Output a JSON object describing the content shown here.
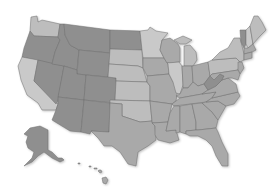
{
  "map": {
    "title": "United States map",
    "colors": {
      "dark": "#8f8f8f",
      "medium": "#a9a9a9",
      "light": "#bdbdbd",
      "lighter": "#c9c9c9",
      "border": "#6e6e6e",
      "background": "#ffffff"
    },
    "regions": [
      {
        "id": "WA",
        "shade": "light"
      },
      {
        "id": "OR",
        "shade": "dark"
      },
      {
        "id": "CA",
        "shade": "lighter"
      },
      {
        "id": "NV",
        "shade": "dark"
      },
      {
        "id": "ID",
        "shade": "dark"
      },
      {
        "id": "MT",
        "shade": "dark"
      },
      {
        "id": "WY",
        "shade": "dark"
      },
      {
        "id": "UT",
        "shade": "dark"
      },
      {
        "id": "CO",
        "shade": "dark"
      },
      {
        "id": "AZ",
        "shade": "dark"
      },
      {
        "id": "NM",
        "shade": "dark"
      },
      {
        "id": "ND",
        "shade": "dark"
      },
      {
        "id": "SD",
        "shade": "light"
      },
      {
        "id": "NE",
        "shade": "light"
      },
      {
        "id": "KS",
        "shade": "light"
      },
      {
        "id": "OK",
        "shade": "light"
      },
      {
        "id": "TX",
        "shade": "medium"
      },
      {
        "id": "MN",
        "shade": "lighter"
      },
      {
        "id": "IA",
        "shade": "medium"
      },
      {
        "id": "MO",
        "shade": "medium"
      },
      {
        "id": "AR",
        "shade": "medium"
      },
      {
        "id": "LA",
        "shade": "medium"
      },
      {
        "id": "WI",
        "shade": "medium"
      },
      {
        "id": "IL",
        "shade": "lighter"
      },
      {
        "id": "MI",
        "shade": "light"
      },
      {
        "id": "IN",
        "shade": "medium"
      },
      {
        "id": "OH",
        "shade": "medium"
      },
      {
        "id": "KY",
        "shade": "medium"
      },
      {
        "id": "TN",
        "shade": "medium"
      },
      {
        "id": "MS",
        "shade": "medium"
      },
      {
        "id": "AL",
        "shade": "medium"
      },
      {
        "id": "GA",
        "shade": "medium"
      },
      {
        "id": "FL",
        "shade": "medium"
      },
      {
        "id": "SC",
        "shade": "medium"
      },
      {
        "id": "NC",
        "shade": "medium"
      },
      {
        "id": "VA",
        "shade": "medium"
      },
      {
        "id": "WV",
        "shade": "dark"
      },
      {
        "id": "PA",
        "shade": "light"
      },
      {
        "id": "NY",
        "shade": "light"
      },
      {
        "id": "VT",
        "shade": "dark"
      },
      {
        "id": "NH",
        "shade": "lighter"
      },
      {
        "id": "ME",
        "shade": "light"
      },
      {
        "id": "MA",
        "shade": "medium"
      },
      {
        "id": "NJ",
        "shade": "medium"
      },
      {
        "id": "MD",
        "shade": "medium"
      },
      {
        "id": "AK",
        "shade": "dark"
      },
      {
        "id": "HI",
        "shade": "medium"
      }
    ]
  }
}
